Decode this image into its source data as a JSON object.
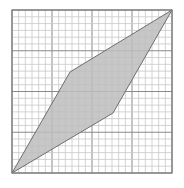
{
  "figure": {
    "type": "grid-with-shaded-quadrilateral",
    "grid": {
      "cells_x": 24,
      "cells_y": 24,
      "left": 12,
      "top": 10,
      "right": 172,
      "bottom": 173,
      "minor_line_color": "#c8c8c8",
      "major_line_color": "#8a8a8a",
      "border_color": "#7a7a7a"
    },
    "shape": {
      "fill": "#bdbdbd",
      "stroke": "#6e6e6e",
      "vertices": [
        {
          "name": "bottom-left",
          "x": 12,
          "y": 173
        },
        {
          "name": "upper-middle",
          "x": 70,
          "y": 72
        },
        {
          "name": "top-right",
          "x": 172,
          "y": 10
        },
        {
          "name": "lower-middle",
          "x": 113,
          "y": 113
        }
      ]
    }
  }
}
